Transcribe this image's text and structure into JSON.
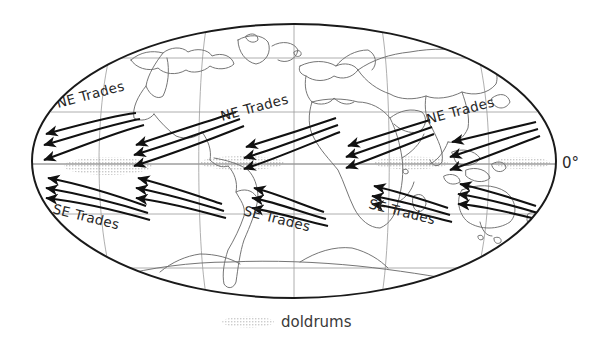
{
  "figure": {
    "projection": "mollweide-ellipse",
    "background_color": "#ffffff",
    "outline_color": "#1a1a1a",
    "graticule_color": "#8a8a8a",
    "coastline_color": "#6e6e6e",
    "arrow_color": "#111111",
    "shading_color": "#c9c9c9"
  },
  "labels": {
    "equator": "0°",
    "caption": "doldrums",
    "ne_trades": "NE Trades",
    "se_trades": "SE Trades"
  },
  "wind_bands": [
    {
      "name": "NE Trades",
      "hemisphere": "north",
      "label": "NE Trades",
      "instances": [
        {
          "id": "ne-trades-1",
          "label_x": 58,
          "label_y": 108,
          "rotation": -15
        },
        {
          "id": "ne-trades-2",
          "label_x": 222,
          "label_y": 118,
          "rotation": -15
        },
        {
          "id": "ne-trades-3",
          "label_x": 428,
          "label_y": 120,
          "rotation": -15
        }
      ]
    },
    {
      "name": "SE Trades",
      "hemisphere": "south",
      "label": "SE Trades",
      "instances": [
        {
          "id": "se-trades-1",
          "label_x": 52,
          "label_y": 212,
          "rotation": 14
        },
        {
          "id": "se-trades-2",
          "label_x": 243,
          "label_y": 214,
          "rotation": 14
        },
        {
          "id": "se-trades-3",
          "label_x": 368,
          "label_y": 206,
          "rotation": 14
        }
      ]
    }
  ],
  "graticule": {
    "latitude_lines": [
      "60N",
      "30N",
      "0",
      "30S",
      "60S"
    ],
    "meridian_count": 5,
    "equator_y": 165
  },
  "doldrums_patches": [
    {
      "x": 66,
      "y": 158,
      "w": 84,
      "h": 16
    },
    {
      "x": 200,
      "y": 156,
      "w": 84,
      "h": 14
    },
    {
      "x": 374,
      "y": 156,
      "w": 74,
      "h": 13
    },
    {
      "x": 494,
      "y": 157,
      "w": 56,
      "h": 12
    },
    {
      "x": 222,
      "y": 316,
      "w": 52,
      "h": 11
    }
  ],
  "arrow_clusters": [
    {
      "id": "cluster-north-1",
      "type": "NE",
      "arrow_count": 3
    },
    {
      "id": "cluster-north-2",
      "type": "NE",
      "arrow_count": 3
    },
    {
      "id": "cluster-north-3",
      "type": "NE",
      "arrow_count": 3
    },
    {
      "id": "cluster-north-4",
      "type": "NE",
      "arrow_count": 3
    },
    {
      "id": "cluster-north-5",
      "type": "NE",
      "arrow_count": 3
    },
    {
      "id": "cluster-south-1",
      "type": "SE",
      "arrow_count": 3
    },
    {
      "id": "cluster-south-2",
      "type": "SE",
      "arrow_count": 3
    },
    {
      "id": "cluster-south-3",
      "type": "SE",
      "arrow_count": 3
    },
    {
      "id": "cluster-south-4",
      "type": "SE",
      "arrow_count": 3
    },
    {
      "id": "cluster-south-5",
      "type": "SE",
      "arrow_count": 3
    }
  ]
}
